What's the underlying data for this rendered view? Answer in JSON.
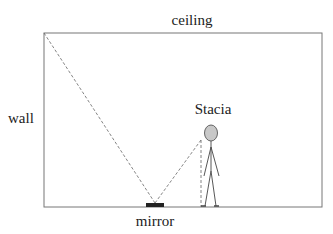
{
  "labels": {
    "ceiling": "ceiling",
    "wall": "wall",
    "person": "Stacia",
    "mirror": "mirror"
  },
  "colors": {
    "line": "#555555",
    "head_fill": "#c8c8c8",
    "mirror_fill": "#222222"
  }
}
